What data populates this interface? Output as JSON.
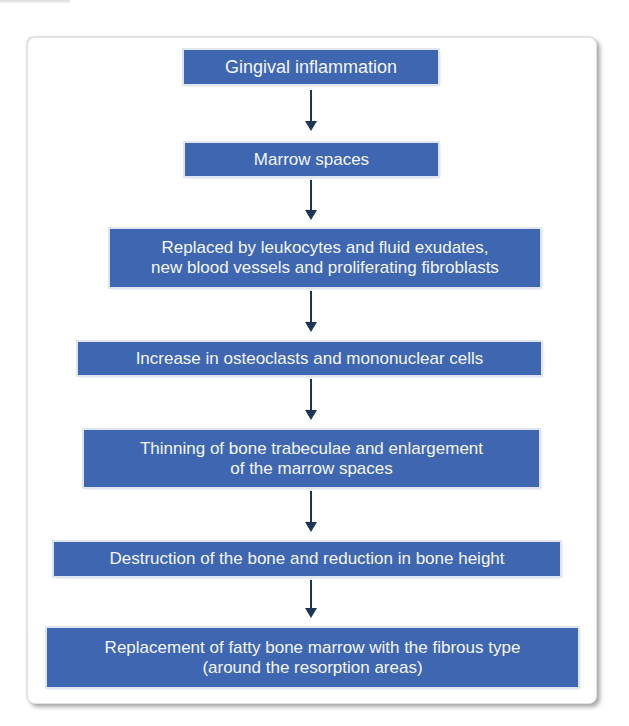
{
  "diagram": {
    "type": "vertical-flowchart",
    "colors": {
      "box_fill": "#3f66b0",
      "box_text": "#f3f6fb",
      "arrow": "#1e3556",
      "panel_border": "#e2e2e2"
    },
    "steps": [
      {
        "label": "Gingival inflammation"
      },
      {
        "label": "Marrow spaces"
      },
      {
        "label": "Replaced by leukocytes and fluid exudates,\nnew blood vessels and proliferating fibroblasts"
      },
      {
        "label": "Increase in osteoclasts and mononuclear cells"
      },
      {
        "label": "Thinning of bone trabeculae and enlargement\nof the marrow spaces"
      },
      {
        "label": "Destruction of the bone and reduction in bone height"
      },
      {
        "label": "Replacement of fatty bone marrow with the fibrous type\n(around the resorption areas)"
      }
    ],
    "arrows": [
      {
        "from": 0,
        "to": 1
      },
      {
        "from": 1,
        "to": 2
      },
      {
        "from": 2,
        "to": 3
      },
      {
        "from": 3,
        "to": 4
      },
      {
        "from": 4,
        "to": 5
      },
      {
        "from": 5,
        "to": 6
      }
    ]
  }
}
